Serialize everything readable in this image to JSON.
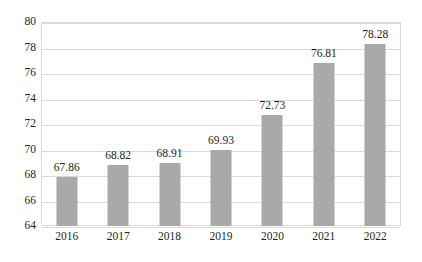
{
  "chart_data": {
    "type": "bar",
    "title": "",
    "subtitle": "",
    "xlabel": "",
    "ylabel": "",
    "categories": [
      "2016",
      "2017",
      "2018",
      "2019",
      "2020",
      "2021",
      "2022"
    ],
    "values": [
      67.86,
      68.82,
      68.91,
      69.93,
      72.73,
      76.81,
      78.28
    ],
    "data_labels": [
      "67.86",
      "68.82",
      "68.91",
      "69.93",
      "72.73",
      "76.81",
      "78.28"
    ],
    "ylim": [
      64,
      80
    ],
    "ytick_step": 2,
    "ytick_labels": [
      "80",
      "78",
      "76",
      "74",
      "72",
      "70",
      "68",
      "66",
      "64"
    ],
    "ytick_values": [
      80,
      78,
      76,
      74,
      72,
      70,
      68,
      66,
      64
    ],
    "grid": true,
    "grid_axis": "y",
    "legend": false,
    "legend_position": "none",
    "series": [
      {
        "name": "",
        "values": [
          67.86,
          68.82,
          68.91,
          69.93,
          72.73,
          76.81,
          78.28
        ],
        "color": "#a9a9a9"
      }
    ]
  },
  "colors": {
    "bar": "#a9a9a9",
    "grid": "#d9d9d9",
    "frame": "#d9d9d9",
    "text": "#231f20",
    "background": "#ffffff"
  }
}
